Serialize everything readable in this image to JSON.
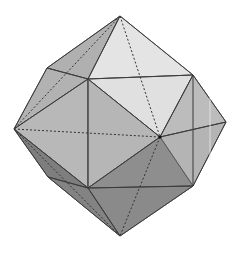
{
  "figure": {
    "colors": {
      "background": "#ffffff",
      "face_light": "#e6e6e6",
      "face_light2": "#d9d9d9",
      "face_mid": "#b4b4b4",
      "face_mid2": "#a8a8a8",
      "face_midlight": "#bdbdbd",
      "face_dark": "#8f8f8f",
      "face_darker": "#7e7e7e",
      "edge": "#3a3a3a"
    }
  }
}
